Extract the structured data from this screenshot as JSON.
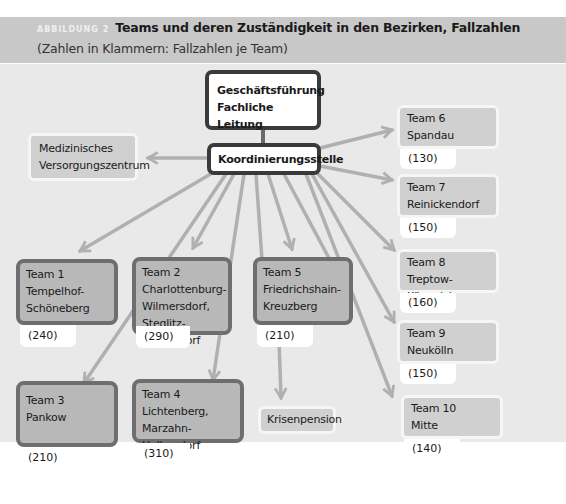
{
  "header": {
    "figure_label": "ABBILDUNG 2",
    "title": "Teams und deren Zuständigkeit in den Bezirken, Fallzahlen",
    "subtitle": "(Zahlen in Klammern: Fallzahlen je Team)"
  },
  "top": {
    "line1": "Geschäftsführung",
    "line2": "Fachliche Leitung"
  },
  "coordination": {
    "label": "Koordinierungsstelle"
  },
  "mvz": {
    "line1": "Medizinisches",
    "line2": "Versorgungszentrum"
  },
  "crisis": {
    "label": "Krisenpension"
  },
  "teams": [
    {
      "name": "Team 1",
      "district": [
        "Tempelhof-",
        "Schöneberg"
      ],
      "count": "(240)"
    },
    {
      "name": "Team 2",
      "district": [
        "Charlottenburg-",
        "Wilmersdorf,",
        "Steglitz-Zehlendorf"
      ],
      "count": "(290)"
    },
    {
      "name": "Team 3",
      "district": [
        "Pankow"
      ],
      "count": "(210)"
    },
    {
      "name": "Team 4",
      "district": [
        "Lichtenberg,",
        "Marzahn-Hellersdorf"
      ],
      "count": "(310)"
    },
    {
      "name": "Team 5",
      "district": [
        "Friedrichshain-",
        "Kreuzberg"
      ],
      "count": "(210)"
    },
    {
      "name": "Team 6",
      "district": [
        "Spandau"
      ],
      "count": "(130)"
    },
    {
      "name": "Team 7",
      "district": [
        "Reinickendorf"
      ],
      "count": "(150)"
    },
    {
      "name": "Team 8",
      "district": [
        "Treptow-Köpenick"
      ],
      "count": "(160)"
    },
    {
      "name": "Team 9",
      "district": [
        "Neukölln"
      ],
      "count": "(150)"
    },
    {
      "name": "Team 10",
      "district": [
        "Mitte"
      ],
      "count": "(140)"
    }
  ],
  "colors": {
    "header_bg": "#c8c8c8",
    "canvas_bg": "#e9e9e9",
    "arrow": "#b0b0b0",
    "team_fill": "#b8b8b8",
    "team_border": "#6e6e6e",
    "dark_border": "#3a3a3a"
  }
}
